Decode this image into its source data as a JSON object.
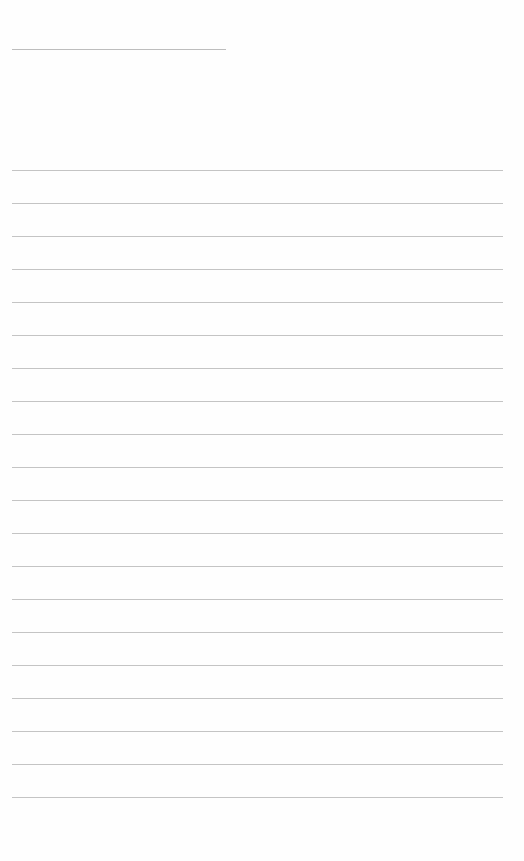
{
  "page": {
    "type": "blank lined paper",
    "background": "#fefefe",
    "line_color": "#c4c4c4",
    "header_line": {
      "x": 12,
      "y": 49,
      "width": 214
    },
    "ruled_lines": {
      "count": 20,
      "start_y": 170,
      "spacing": 33,
      "x": 12,
      "width": 491
    }
  }
}
